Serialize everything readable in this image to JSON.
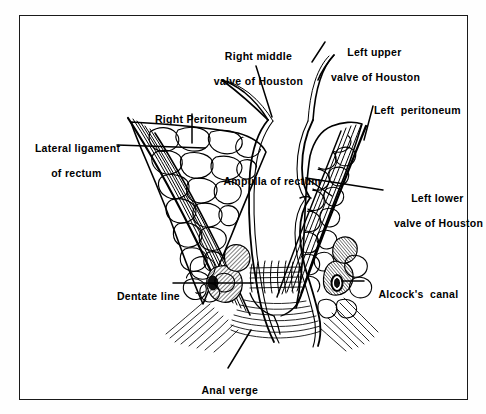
{
  "figure": {
    "type": "anatomical-line-diagram",
    "frame_color": "#1a1a1a",
    "ink_color": "#000000",
    "background_color": "#ffffff"
  },
  "labels": {
    "right_middle_valve": {
      "line1": "Right middle",
      "line2": "valve of Houston"
    },
    "left_upper_valve": {
      "line1": "Left upper",
      "line2": "valve of Houston"
    },
    "right_peritoneum": {
      "line1": "Right Peritoneum"
    },
    "left_peritoneum": {
      "line1": "Left  peritoneum"
    },
    "lateral_ligament": {
      "line1": "Lateral ligament",
      "line2": "of rectum"
    },
    "ampulla_of_rectum": {
      "line1": "Ampulla of rectum"
    },
    "left_lower_valve": {
      "line1": "Left lower",
      "line2": "valve of Houston"
    },
    "dentate_line": {
      "line1": "Dentate line"
    },
    "alcocks_canal": {
      "line1": "Alcock's  canal"
    },
    "anal_verge": {
      "line1": "Anal verge"
    }
  },
  "structures": [
    "rectal ampulla lumen",
    "valves of Houston",
    "mesorectal fat lobules",
    "lateral ligaments of rectum",
    "levator ani muscle fibers",
    "columns of Morgagni",
    "internal and external anal sphincter",
    "Alcock's canal (pudendal canal)",
    "anal verge"
  ]
}
